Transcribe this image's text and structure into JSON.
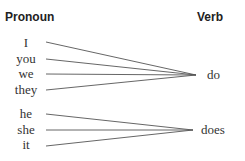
{
  "headers": {
    "pronoun": "Pronoun",
    "verb": "Verb"
  },
  "groups": [
    {
      "verb": "do",
      "pronouns": [
        "I",
        "you",
        "we",
        "they"
      ]
    },
    {
      "verb": "does",
      "pronouns": [
        "he",
        "she",
        "it"
      ]
    }
  ],
  "colors": {
    "text": "#333333",
    "line": "#555555"
  }
}
